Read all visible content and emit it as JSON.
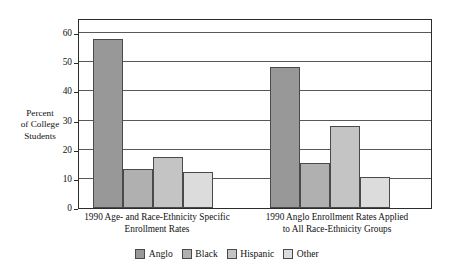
{
  "chart_data": {
    "type": "bar",
    "title": "",
    "subtitle": "",
    "xlabel": "",
    "ylabel": "Percent of College Students",
    "ylabel_lines": [
      "Percent",
      "of College",
      "Students"
    ],
    "ylim": [
      0,
      60
    ],
    "yticks": [
      0,
      10,
      20,
      30,
      40,
      50,
      60
    ],
    "ytick_labels": [
      "0",
      "10",
      "20",
      "30",
      "40",
      "50",
      "60"
    ],
    "frame_top_value": 65,
    "grid": true,
    "grid_axis": "y",
    "legend_position": "bottom-center",
    "categories": [
      "1990 Age- and Race-Ethnicity Specific Enrollment Rates",
      "1990 Anglo Enrollment Rates Applied to All Race-Ethnicity Groups"
    ],
    "category_label_lines": [
      [
        "1990 Age- and Race-Ethnicity Specific",
        "Enrollment Rates"
      ],
      [
        "1990 Anglo Enrollment Rates Applied",
        "to All Race-Ethnicity Groups"
      ]
    ],
    "series": [
      {
        "name": "Anglo",
        "color": "#989898",
        "values": [
          58.0,
          48.5
        ]
      },
      {
        "name": "Black",
        "color": "#b0b0b0",
        "values": [
          13.3,
          15.5
        ]
      },
      {
        "name": "Hispanic",
        "color": "#c4c4c4",
        "values": [
          17.5,
          28.0
        ]
      },
      {
        "name": "Other",
        "color": "#dcdcdc",
        "values": [
          12.2,
          10.5
        ]
      }
    ]
  },
  "legend": {
    "items": [
      {
        "label": "Anglo",
        "color": "#989898"
      },
      {
        "label": "Black",
        "color": "#b0b0b0"
      },
      {
        "label": "Hispanic",
        "color": "#c4c4c4"
      },
      {
        "label": "Other",
        "color": "#dcdcdc"
      }
    ]
  },
  "style": {
    "background": "#ffffff",
    "frame_color": "#2c2c2c",
    "grid_color": "#585858",
    "bar_edge_color": "#4a4a4a",
    "text_color": "#111111"
  }
}
